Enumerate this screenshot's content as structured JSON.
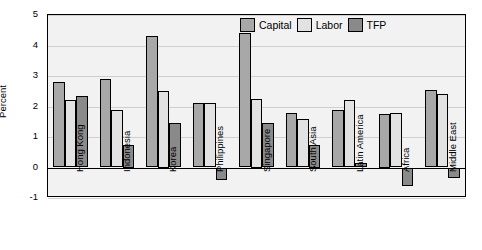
{
  "chart_data": {
    "type": "bar",
    "title": "",
    "xlabel": "",
    "ylabel": "Percent",
    "ylim": [
      -1,
      5
    ],
    "yticks": [
      5,
      4,
      3,
      2,
      1,
      0,
      -1
    ],
    "ytick_labels": [
      "5",
      "4",
      "3",
      "2",
      "1",
      "0",
      "-1"
    ],
    "grid": true,
    "legend_position": "top-right",
    "categories": [
      "Hong Kong",
      "Indonesia",
      "Korea",
      "Philippines",
      "Singapore",
      "South Asia",
      "Latin America",
      "Africa",
      "Middle East"
    ],
    "series": [
      {
        "name": "Capital",
        "color": "#a8a8a8",
        "values": [
          2.8,
          2.9,
          4.3,
          2.1,
          4.4,
          1.8,
          1.9,
          1.75,
          2.55
        ]
      },
      {
        "name": "Labor",
        "color": "#e2e2e2",
        "values": [
          2.2,
          1.9,
          2.5,
          2.1,
          2.25,
          1.6,
          2.2,
          1.8,
          2.4
        ]
      },
      {
        "name": "TFP",
        "color": "#8a8a8a",
        "values": [
          2.35,
          0.75,
          1.45,
          -0.4,
          1.45,
          0.75,
          0.15,
          -0.6,
          -0.35
        ]
      }
    ]
  },
  "legend": {
    "items": [
      {
        "label": "Capital",
        "swatch": "capital"
      },
      {
        "label": "Labor",
        "swatch": "labor"
      },
      {
        "label": "TFP",
        "swatch": "tfp"
      }
    ]
  }
}
